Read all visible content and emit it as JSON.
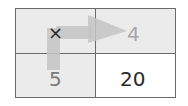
{
  "diagram": {
    "operator": "×",
    "top_right_value": "4",
    "bottom_left_value": "5",
    "bottom_right_value": "20",
    "colors": {
      "border": "#6a6a6a",
      "shaded_cell": "#ebebeb",
      "arrow": "#c4c4c4",
      "result_text": "#2a2a2a",
      "faded_text": "#a8a8a8"
    }
  }
}
